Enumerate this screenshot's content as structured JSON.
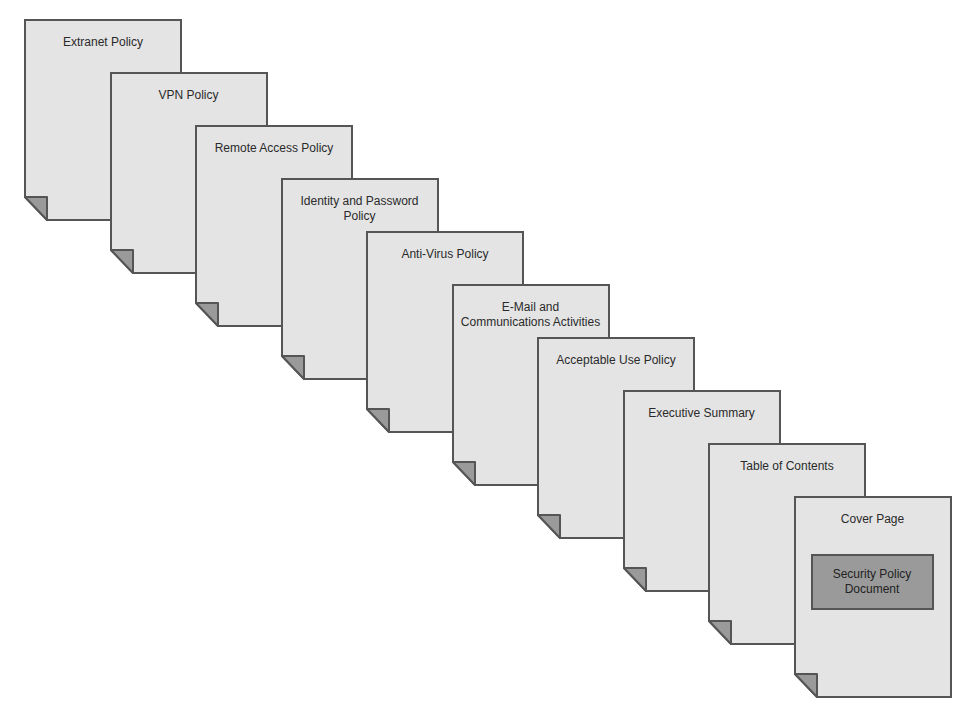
{
  "diagram": {
    "type": "stacked-document-pages",
    "colors": {
      "page_fill": "#e4e4e4",
      "page_border": "#555555",
      "fold_fill": "#9a9a9a",
      "cover_box_fill": "#9a9a9a"
    },
    "pages": [
      {
        "label": "Extranet Policy"
      },
      {
        "label": "VPN Policy"
      },
      {
        "label": "Remote Access Policy"
      },
      {
        "label": "Identity and Password Policy"
      },
      {
        "label": "Anti-Virus Policy"
      },
      {
        "label": "E-Mail and Communications Activities"
      },
      {
        "label": "Acceptable Use Policy"
      },
      {
        "label": "Executive Summary"
      },
      {
        "label": "Table of Contents"
      },
      {
        "label": "Cover Page",
        "box_label": "Security Policy Document"
      }
    ]
  }
}
